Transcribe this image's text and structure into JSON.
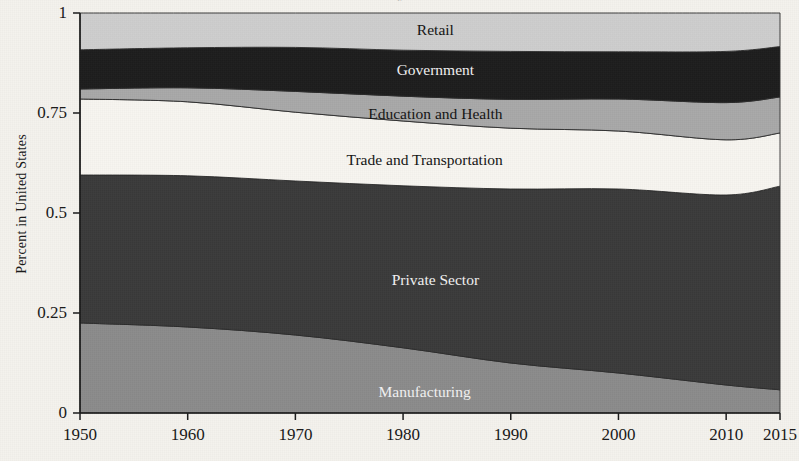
{
  "figure": {
    "clipped_title": "y",
    "y_axis_label": "Percent in United States"
  },
  "axes": {
    "y_ticks": [
      "0",
      "0.25",
      "0.5",
      "0.75",
      "1"
    ],
    "y_tick_values": [
      0,
      0.25,
      0.5,
      0.75,
      1
    ],
    "x_ticks": [
      "1950",
      "1960",
      "1970",
      "1980",
      "1990",
      "2000",
      "2010",
      "2015"
    ],
    "x_tick_values": [
      1950,
      1960,
      1970,
      1980,
      1990,
      2000,
      2010,
      2015
    ]
  },
  "colors": {
    "retail": "#cdcdcd",
    "government": "#1c1c1c",
    "education_and_health": "#a8a8a8",
    "trade_and_transportation": "#f7f5f0",
    "private_sector": "#3a3a3a",
    "manufacturing": "#8b8b8b",
    "axis": "#1a1a1a",
    "background": "#f4f2ed"
  },
  "chart_data": {
    "type": "area",
    "title": "",
    "subtitle": "",
    "xlabel": "",
    "ylabel": "Percent in United States",
    "xlim": [
      1950,
      2015
    ],
    "ylim": [
      0,
      1
    ],
    "grid": false,
    "legend": "inline-band-labels",
    "stacked": true,
    "stack_order_bottom_to_top": [
      "Manufacturing",
      "Private Sector",
      "Trade and Transportation",
      "Education and Health",
      "Government",
      "Retail"
    ],
    "x": [
      1950,
      1960,
      1970,
      1980,
      1990,
      2000,
      2010,
      2015
    ],
    "series": [
      {
        "name": "Manufacturing",
        "color": "#8b8b8b",
        "label_x": 1982,
        "label_y": 0.05,
        "label_color": "light",
        "values": [
          0.225,
          0.215,
          0.195,
          0.163,
          0.125,
          0.1,
          0.07,
          0.058
        ]
      },
      {
        "name": "Private Sector",
        "color": "#3a3a3a",
        "label_x": 1983,
        "label_y": 0.33,
        "label_color": "light",
        "values": [
          0.37,
          0.378,
          0.385,
          0.405,
          0.435,
          0.46,
          0.475,
          0.509
        ]
      },
      {
        "name": "Trade and Transportation",
        "color": "#f7f5f0",
        "label_x": 1982,
        "label_y": 0.63,
        "label_color": "dark",
        "values": [
          0.19,
          0.185,
          0.172,
          0.162,
          0.152,
          0.145,
          0.138,
          0.133
        ]
      },
      {
        "name": "Education and Health",
        "color": "#a8a8a8",
        "label_x": 1983,
        "label_y": 0.745,
        "label_color": "dark",
        "values": [
          0.025,
          0.035,
          0.052,
          0.062,
          0.072,
          0.08,
          0.093,
          0.09
        ]
      },
      {
        "name": "Government",
        "color": "#1c1c1c",
        "label_x": 1983,
        "label_y": 0.855,
        "label_color": "light",
        "values": [
          0.098,
          0.1,
          0.11,
          0.115,
          0.12,
          0.118,
          0.128,
          0.126
        ]
      },
      {
        "name": "Retail",
        "color": "#cdcdcd",
        "label_x": 1983,
        "label_y": 0.955,
        "label_color": "dark",
        "values": [
          0.092,
          0.087,
          0.086,
          0.093,
          0.096,
          0.097,
          0.096,
          0.084
        ]
      }
    ],
    "cumulative_top_boundaries": {
      "Manufacturing": [
        0.225,
        0.215,
        0.195,
        0.163,
        0.125,
        0.1,
        0.07,
        0.058
      ],
      "Private Sector": [
        0.595,
        0.593,
        0.58,
        0.568,
        0.56,
        0.56,
        0.545,
        0.567
      ],
      "Trade and Transportation": [
        0.785,
        0.778,
        0.752,
        0.73,
        0.712,
        0.705,
        0.683,
        0.7
      ],
      "Education and Health": [
        0.81,
        0.813,
        0.804,
        0.792,
        0.784,
        0.785,
        0.776,
        0.79
      ],
      "Government": [
        0.908,
        0.913,
        0.914,
        0.907,
        0.904,
        0.903,
        0.904,
        0.916
      ],
      "Retail": [
        1.0,
        1.0,
        1.0,
        1.0,
        1.0,
        1.0,
        1.0,
        1.0
      ]
    }
  }
}
